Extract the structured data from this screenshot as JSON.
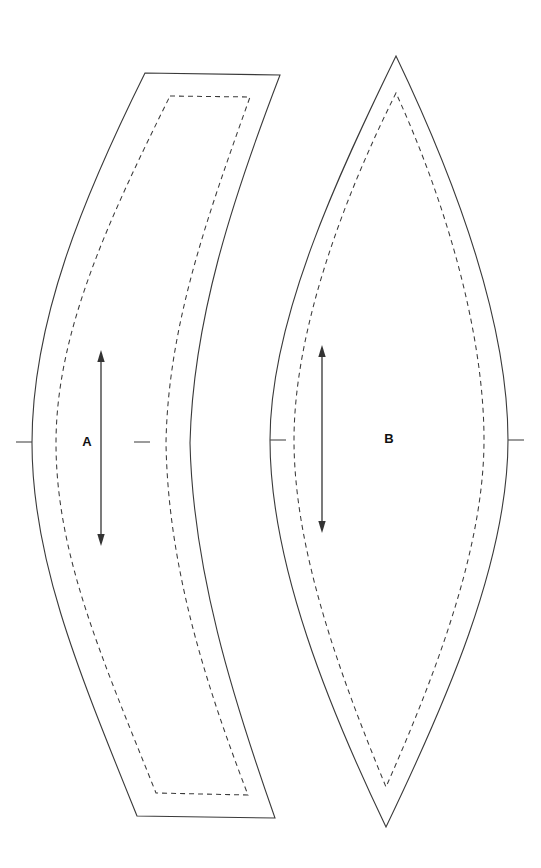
{
  "sheet": {
    "title": "Sewing Pattern Sheet",
    "background_color": "#ffffff",
    "width": 541,
    "height": 868
  },
  "style": {
    "cut_line_color": "#3a3a3a",
    "seam_line_color": "#3a3a3a",
    "grain_line_color": "#333333",
    "label_color": "#111111",
    "seam_dash": "5 4",
    "seam_allowance_px": 22
  },
  "pieces": [
    {
      "id": "piece-a",
      "label": "A",
      "label_x": 87,
      "label_y": 443,
      "shape": "crescent",
      "cut_path": "M 145 73 L 280 75 C 232 200 193 320 190 443 C 193 570 232 696 275 818 L 137 816 C 78 670 32 560 32 443 C 32 320 84 196 145 73 Z",
      "seam_path": "M 170 96 L 250 97 C 208 215 168 325 166 443 C 168 565 204 680 248 795 L 156 793 C 103 660 56 556 56 443 C 56 330 111 215 170 96 Z",
      "grainline": {
        "x": 101,
        "y1": 353,
        "y2": 543,
        "double_headed": true
      },
      "notches": [
        {
          "name": "notch-left",
          "x": 32,
          "y": 442,
          "dx": -16
        },
        {
          "name": "notch-right",
          "x": 150,
          "y": 442,
          "dx": -16
        }
      ]
    },
    {
      "id": "piece-b",
      "label": "B",
      "label_x": 389,
      "label_y": 440,
      "shape": "lens",
      "cut_path": "M 396 56 C 338 175 270 320 270 440 C 270 565 330 710 386 827 C 444 706 508 563 508 440 C 508 318 452 173 396 56 Z",
      "seam_path": "M 396 93 C 344 197 294 330 294 440 C 294 552 342 680 386 787 C 434 678 484 550 484 440 C 484 330 444 198 396 93 Z",
      "grainline": {
        "x": 322,
        "y1": 348,
        "y2": 530,
        "double_headed": true
      },
      "notches": [
        {
          "name": "notch-left",
          "x": 270,
          "y": 440,
          "dx": 16
        },
        {
          "name": "notch-right",
          "x": 508,
          "y": 440,
          "dx": 16
        }
      ]
    }
  ]
}
